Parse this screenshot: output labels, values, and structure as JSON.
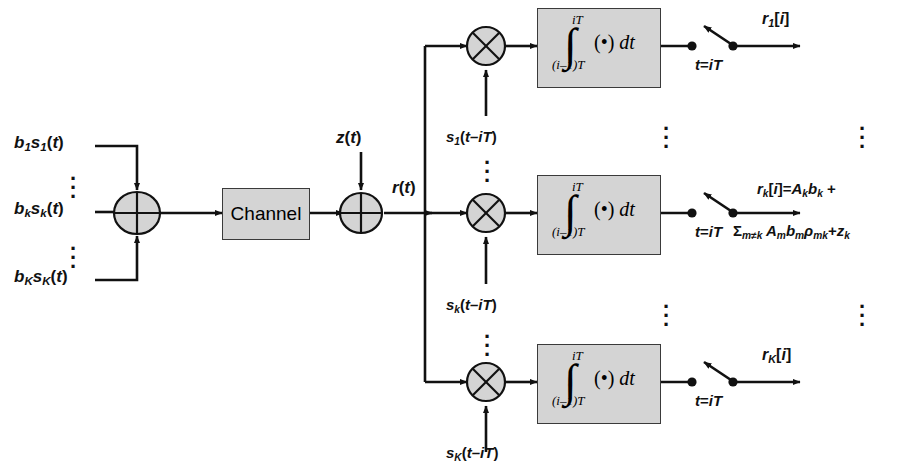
{
  "diagram": {
    "colors": {
      "block_fill": "#d4d4d4",
      "block_stroke": "#3a3a3a",
      "wire": "#111111",
      "background": "#ffffff"
    },
    "transmitter": {
      "inputs": [
        {
          "id": "in-1",
          "label": "b1s1(t)",
          "sub_main": "1",
          "base": "b",
          "second": "s"
        },
        {
          "id": "in-k",
          "label": "bksk(t)"
        },
        {
          "id": "in-K",
          "label": "bKsK(t)"
        }
      ],
      "input_ellipsis_count": 2,
      "summer_name": "transmit-summer"
    },
    "channel": {
      "label": "Channel"
    },
    "noise": {
      "label": "z(t)",
      "summer_name": "noise-summer"
    },
    "received": {
      "label": "r(t)"
    },
    "branches": [
      {
        "id": "branch-1",
        "local_code": "s1(t–iT)",
        "integrator": {
          "upper_limit": "iT",
          "lower_limit": "(i–1)T",
          "integrand": "(•) dt"
        },
        "sampler_label": "t=iT",
        "output": "r1[i]",
        "output_line2": ""
      },
      {
        "id": "branch-k",
        "local_code": "sk(t–iT)",
        "integrator": {
          "upper_limit": "iT",
          "lower_limit": "(i–1)T",
          "integrand": "(•) dt"
        },
        "sampler_label": "t=iT",
        "output": "rk[i]=Akbk +",
        "output_line2": "Σm≠k Ambmρmk+zk"
      },
      {
        "id": "branch-K",
        "local_code": "sK(t–iT)",
        "integrator": {
          "upper_limit": "iT",
          "lower_limit": "(i–1)T",
          "integrand": "(•) dt"
        },
        "sampler_label": "t=iT",
        "output": "rK[i]",
        "output_line2": ""
      }
    ],
    "ellipsis": {
      "glyph": "⋮",
      "count": 3
    }
  }
}
